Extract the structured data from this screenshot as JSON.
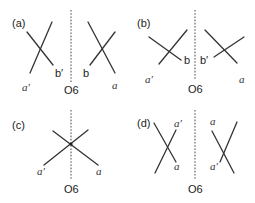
{
  "panels": [
    {
      "id": "a",
      "label": "(a)",
      "mirror_label": "O6",
      "left_labels": {
        "top": "",
        "end1": "b′",
        "end2": "a′"
      },
      "right_labels": {
        "end1": "b",
        "end2": "a"
      }
    },
    {
      "id": "b",
      "label": "(b)",
      "mirror_label": "O6",
      "left_labels": {
        "end1": "b",
        "end2": "a′"
      },
      "right_labels": {
        "end1": "b′",
        "end2": "a"
      }
    },
    {
      "id": "c",
      "label": "(c)",
      "mirror_label": "O6",
      "labels": {
        "left": "a′",
        "right": "a"
      }
    },
    {
      "id": "d",
      "label": "(d)",
      "mirror_label": "O6",
      "left_labels": {
        "top": "a′",
        "bottom": "a"
      },
      "right_labels": {
        "top": "a",
        "bottom": "a′"
      }
    }
  ]
}
